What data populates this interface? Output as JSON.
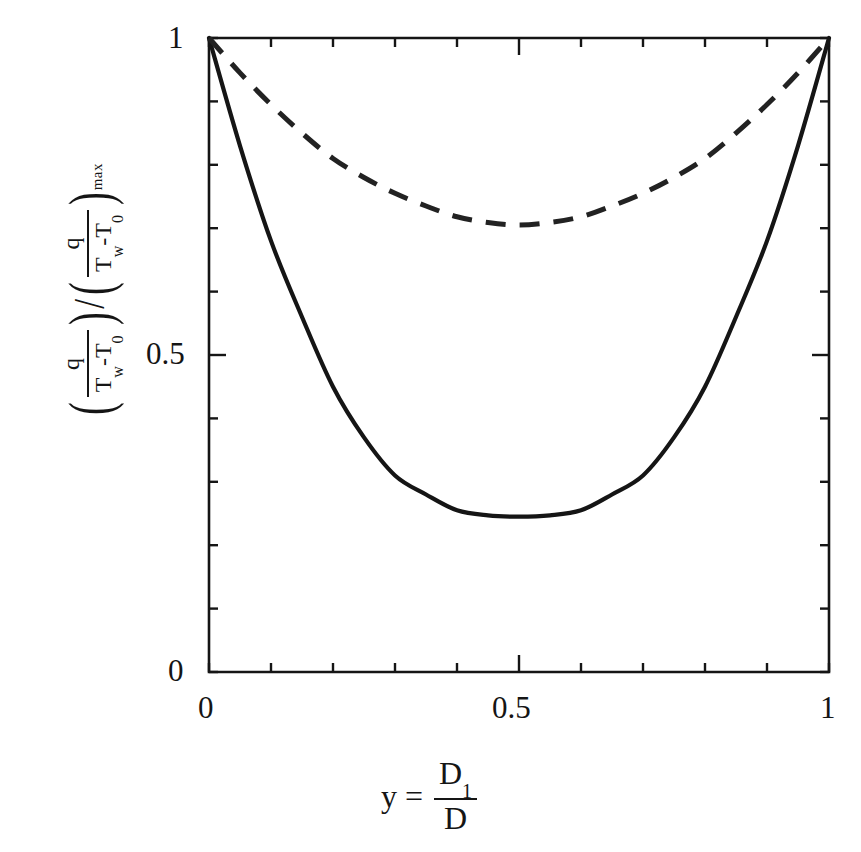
{
  "figure": {
    "background": "#ffffff",
    "ink_color": "#151515",
    "plot_box": {
      "left": 209,
      "top": 38,
      "right": 829,
      "bottom": 672
    }
  },
  "axes": {
    "y": {
      "ticks": [
        "1",
        "0.5",
        "0"
      ],
      "tick_values": [
        1,
        0.5,
        0
      ],
      "minor_step": 0.1,
      "title_parts": {
        "num1": "q",
        "den1_T": "T",
        "den1_w": "w",
        "den1_minus": "-T",
        "den1_zero": "0",
        "slash": "/",
        "num2": "q",
        "den2_T": "T",
        "den2_w": "w",
        "den2_minus": "-T",
        "den2_zero": "0",
        "max_sub": "max"
      }
    },
    "x": {
      "ticks": [
        "0",
        "0.5",
        "1"
      ],
      "tick_values": [
        0,
        0.5,
        1
      ],
      "minor_step": 0.1,
      "title_parts": {
        "variable": "y",
        "equals": "=",
        "num": "D",
        "num_sub": "1",
        "den": "D"
      }
    }
  },
  "chart_data": {
    "type": "line",
    "title": "",
    "xlabel": "y = D1/D",
    "ylabel": "(q/(Tw-T0)) / (q/(Tw-T0))max",
    "xlim": [
      0,
      1
    ],
    "ylim": [
      0,
      1
    ],
    "grid": false,
    "legend": "none",
    "x": [
      0,
      0.05,
      0.1,
      0.15,
      0.2,
      0.25,
      0.3,
      0.35,
      0.4,
      0.45,
      0.5,
      0.55,
      0.6,
      0.65,
      0.7,
      0.75,
      0.8,
      0.85,
      0.9,
      0.95,
      1
    ],
    "series": [
      {
        "name": "solid-curve",
        "style": "solid",
        "values": [
          1.0,
          0.83,
          0.68,
          0.56,
          0.45,
          0.37,
          0.31,
          0.28,
          0.255,
          0.247,
          0.245,
          0.247,
          0.255,
          0.28,
          0.31,
          0.37,
          0.45,
          0.56,
          0.68,
          0.83,
          1.0
        ],
        "minimum": {
          "x": 0.5,
          "y": 0.245
        }
      },
      {
        "name": "dashed-curve",
        "style": "dashed",
        "values": [
          1.0,
          0.945,
          0.895,
          0.85,
          0.81,
          0.78,
          0.755,
          0.735,
          0.718,
          0.709,
          0.705,
          0.709,
          0.718,
          0.735,
          0.755,
          0.78,
          0.81,
          0.85,
          0.895,
          0.945,
          1.0
        ],
        "minimum": {
          "x": 0.5,
          "y": 0.705
        }
      }
    ]
  }
}
